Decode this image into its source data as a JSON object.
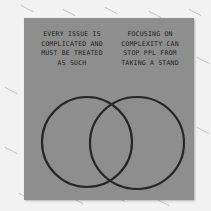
{
  "image": {
    "subject": "Sticky note with hand-drawn Venn diagram",
    "colors": {
      "background": "#f2f2f2",
      "note": "#8e8e8e",
      "ink": "#222222"
    }
  },
  "note": {
    "left_label": "EVERY ISSUE IS COMPLICATED AND MUST BE TREATED AS SUCH",
    "right_label": "FOCUSING ON COMPLEXITY CAN STOP PPL FROM TAKING A STAND"
  },
  "diagram": {
    "type": "venn",
    "circles": 2
  }
}
